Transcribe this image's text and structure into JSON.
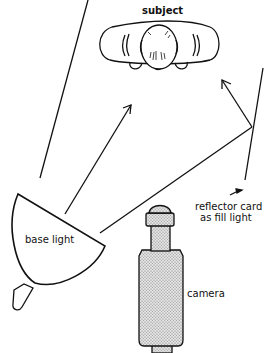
{
  "diagram": {
    "type": "lighting-setup",
    "labels": {
      "subject": "subject",
      "base_light": "base light",
      "reflector_line1": "reflector card",
      "reflector_line2": "as fill light",
      "camera": "camera"
    },
    "colors": {
      "line": "#111111",
      "camera_fill": "#c8c8c8",
      "background": "#ffffff"
    },
    "elements": [
      {
        "id": "subject",
        "description": "top view of person lying/seated, head center"
      },
      {
        "id": "base-light",
        "description": "bowl-shaped lamp lower left aimed up-right"
      },
      {
        "id": "reflector-card",
        "description": "long line at right acting as fill reflector"
      },
      {
        "id": "camera",
        "description": "stippled camera at bottom center pointing up"
      }
    ]
  }
}
